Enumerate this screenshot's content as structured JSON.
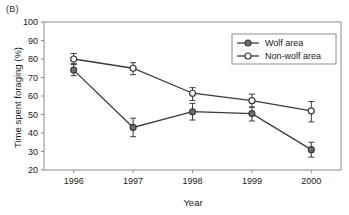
{
  "figure": {
    "panel_label": "(B)",
    "background_color": "#ffffff",
    "frame_color": "#8c8c8c",
    "series_color": "#3a3a3a",
    "marker_fill_color": "#6e6e6e",
    "marker_open_color": "#ffffff"
  },
  "chart_data": {
    "type": "line",
    "title": "",
    "subtitle": "",
    "panel": "(B)",
    "xlabel": "Year",
    "ylabel": "Time spent foraging (%)",
    "categories": [
      "1996",
      "1997",
      "1998",
      "1999",
      "2000"
    ],
    "x": [
      1996,
      1997,
      1998,
      1999,
      2000
    ],
    "xlim": [
      1995.5,
      2000.5
    ],
    "ylim": [
      20,
      100
    ],
    "yticks": [
      20,
      30,
      40,
      50,
      60,
      70,
      80,
      90,
      100
    ],
    "ytick_labels": [
      "20",
      "30",
      "40",
      "50",
      "60",
      "70",
      "80",
      "90",
      "100"
    ],
    "xticks": [
      1996,
      1997,
      1998,
      1999,
      2000
    ],
    "xtick_labels": [
      "1996",
      "1997",
      "1998",
      "1999",
      "2000"
    ],
    "grid": false,
    "legend_position": "upper right",
    "legend_boxed": true,
    "error_bars": true,
    "series": [
      {
        "name": "Wolf area",
        "marker": "filled-circle",
        "values": [
          74,
          43,
          51.5,
          50.5,
          31
        ],
        "err_low": [
          71,
          38,
          47,
          46.5,
          27
        ],
        "err_high": [
          77,
          48,
          56,
          54,
          35
        ]
      },
      {
        "name": "Non-wolf area",
        "marker": "open-circle",
        "values": [
          80,
          75,
          61.5,
          57.5,
          52
        ],
        "err_low": [
          77.5,
          71.5,
          57.5,
          54,
          46
        ],
        "err_high": [
          83,
          78,
          64.5,
          61,
          57
        ]
      }
    ],
    "legend": [
      "Wolf area",
      "Non-wolf area"
    ]
  }
}
